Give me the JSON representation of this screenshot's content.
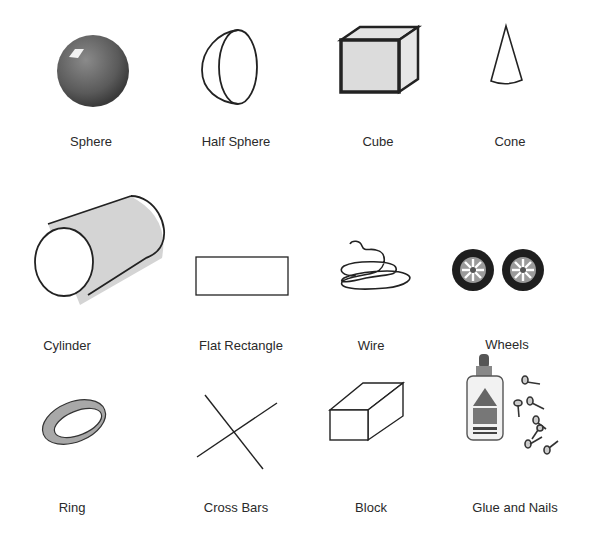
{
  "items": [
    {
      "id": "sphere",
      "label": "Sphere"
    },
    {
      "id": "half-sphere",
      "label": "Half Sphere"
    },
    {
      "id": "cube",
      "label": "Cube"
    },
    {
      "id": "cone",
      "label": "Cone"
    },
    {
      "id": "cylinder",
      "label": "Cylinder"
    },
    {
      "id": "flat-rectangle",
      "label": "Flat Rectangle"
    },
    {
      "id": "wire",
      "label": "Wire"
    },
    {
      "id": "wheels",
      "label": "Wheels"
    },
    {
      "id": "ring",
      "label": "Ring"
    },
    {
      "id": "cross-bars",
      "label": "Cross Bars"
    },
    {
      "id": "block",
      "label": "Block"
    },
    {
      "id": "glue-and-nails",
      "label": "Glue and Nails"
    }
  ],
  "colors": {
    "stroke": "#222222",
    "fill_gray": "#d6d6d6",
    "sphere": "#5e5e5e"
  }
}
